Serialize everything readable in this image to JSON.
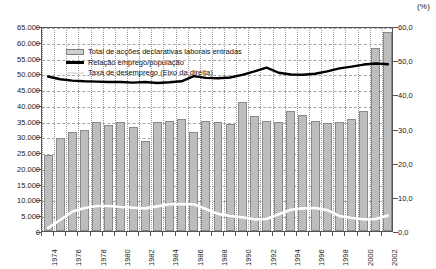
{
  "chart_data": {
    "type": "bar",
    "title": "",
    "xlabel": "",
    "ylabel": "",
    "right_axis_unit": "(%)",
    "grid": true,
    "legend_position": "top-left-inside",
    "ylim": [
      0,
      65000
    ],
    "y2lim": [
      0,
      60
    ],
    "yticks": [
      "0",
      "5.000",
      "10.000",
      "15.000",
      "20.000",
      "25.000",
      "30.000",
      "35.000",
      "40.000",
      "45.000",
      "50.000",
      "55.000",
      "60.000",
      "65.000"
    ],
    "y2ticks": [
      "0,0",
      "10,0",
      "20,0",
      "30,0",
      "40,0",
      "50,0",
      "60,0"
    ],
    "categories": [
      1974,
      1975,
      1976,
      1977,
      1978,
      1979,
      1980,
      1981,
      1982,
      1983,
      1984,
      1985,
      1986,
      1987,
      1988,
      1989,
      1990,
      1991,
      1992,
      1993,
      1994,
      1995,
      1996,
      1997,
      1998,
      1999,
      2000,
      2001,
      2002
    ],
    "xtick_labels": [
      "1974",
      "1976",
      "1978",
      "1980",
      "1982",
      "1984",
      "1986",
      "1988",
      "1990",
      "1992",
      "1994",
      "1996",
      "1998",
      "2000",
      "2002"
    ],
    "series": [
      {
        "name": "Total de acções declarativas laborais entradas",
        "type": "bar",
        "axis": "left",
        "color": "#bdbdbd",
        "edge_color": "#8a8a8a",
        "values": [
          24000,
          29500,
          31500,
          32000,
          34500,
          33500,
          34500,
          33000,
          28500,
          34500,
          35000,
          35500,
          31500,
          35000,
          34500,
          34000,
          41000,
          36500,
          35000,
          34700,
          38000,
          36800,
          34800,
          34200,
          34500,
          35400,
          38200,
          58000,
          63000
        ]
      },
      {
        "name": "Relação emprego/população",
        "type": "line",
        "axis": "right",
        "color": "#000000",
        "values": [
          45.8,
          45.0,
          44.6,
          44.4,
          44.3,
          44.2,
          44.2,
          44.0,
          44.2,
          43.9,
          44.1,
          44.4,
          45.9,
          45.4,
          45.3,
          45.5,
          46.3,
          47.3,
          48.4,
          46.9,
          46.4,
          46.3,
          46.6,
          47.3,
          48.2,
          48.7,
          49.3,
          49.6,
          49.4
        ]
      },
      {
        "name": "Taxa de desemprego (Eixo da direita)",
        "type": "line",
        "axis": "right",
        "color": "#ffffff",
        "values": [
          1.5,
          3.8,
          6.3,
          7.3,
          7.9,
          7.9,
          7.6,
          7.4,
          7.2,
          7.8,
          8.4,
          8.5,
          8.4,
          7.0,
          5.6,
          5.0,
          4.6,
          4.0,
          4.1,
          5.5,
          6.8,
          7.2,
          7.3,
          6.7,
          5.0,
          4.4,
          4.0,
          4.1,
          5.1
        ]
      }
    ],
    "legend_entries": [
      {
        "label": "Total de acções declarativas laborais entradas",
        "marker": "bar-swatch"
      },
      {
        "label": "Relação emprego/população",
        "marker": "black-line"
      },
      {
        "label": "Taxa de desemprego (Eixo da direita)",
        "marker": "white-line"
      }
    ]
  }
}
